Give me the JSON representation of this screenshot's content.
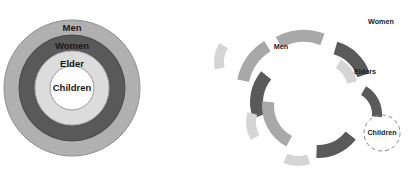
{
  "figure": {
    "title": "",
    "panels": [
      {
        "id": "concentric",
        "name": "concentric-rings-diagram",
        "type": "bullseye",
        "center": {
          "x": 72,
          "y": 88
        },
        "rings": [
          {
            "label": "Men",
            "outer_r": 68,
            "inner_r": 53,
            "color": "#b0b0b0",
            "stroke": "#8f8f8f"
          },
          {
            "label": "Women",
            "outer_r": 53,
            "inner_r": 37,
            "color": "#595959",
            "stroke": "#4a4a4a"
          },
          {
            "label": "Elder",
            "outer_r": 37,
            "inner_r": 22,
            "color": "#dcdcdc",
            "stroke": "#b5b5b5"
          },
          {
            "label": "Children",
            "outer_r": 22,
            "inner_r": 0,
            "color": "#ffffff",
            "stroke": "#9a9a9a"
          }
        ],
        "label_positions": [
          {
            "text": "Men",
            "x": 72,
            "y": 28
          },
          {
            "text": "Women",
            "x": 72,
            "y": 46
          },
          {
            "text": "Elder",
            "x": 72,
            "y": 64
          },
          {
            "text": "Children",
            "x": 72,
            "y": 88
          }
        ]
      },
      {
        "id": "exploded",
        "name": "exploded-arcs-diagram",
        "type": "scattered-arc-fragments",
        "center": {
          "x": 312,
          "y": 96
        },
        "colors": {
          "dark": "#5a5a5a",
          "medium": "#a8a8a8",
          "light": "#d5d5d5",
          "dashed_outline": "#8a8a8a"
        },
        "labels": [
          {
            "text": "Women",
            "x": 381,
            "y": 22
          },
          {
            "text": "Men",
            "x": 281,
            "y": 47
          },
          {
            "text": "Elders",
            "x": 365,
            "y": 72
          },
          {
            "text": "Children",
            "x": 382,
            "y": 133
          }
        ],
        "children_circle": {
          "cx": 382,
          "cy": 133,
          "r": 18,
          "style": "dashed"
        },
        "fragments": [
          {
            "name": "arc-men-upper",
            "cx": 312,
            "cy": 96,
            "r_out": 60,
            "r_in": 48,
            "a0": -118,
            "a1": -70,
            "tone": "medium",
            "dx": -8,
            "dy": -6
          },
          {
            "name": "arc-men-left",
            "cx": 312,
            "cy": 96,
            "r_out": 60,
            "r_in": 48,
            "a0": -168,
            "a1": -122,
            "tone": "medium",
            "dx": -16,
            "dy": -4
          },
          {
            "name": "arc-women-topright",
            "cx": 312,
            "cy": 96,
            "r_out": 48,
            "r_in": 35,
            "a0": -74,
            "a1": -18,
            "tone": "dark",
            "dx": 12,
            "dy": -8
          },
          {
            "name": "arc-women-left",
            "cx": 312,
            "cy": 96,
            "r_out": 48,
            "r_in": 35,
            "a0": 160,
            "a1": 220,
            "tone": "dark",
            "dx": -14,
            "dy": 6
          },
          {
            "name": "arc-women-bottom",
            "cx": 312,
            "cy": 96,
            "r_out": 48,
            "r_in": 35,
            "a0": 38,
            "a1": 92,
            "tone": "dark",
            "dx": 6,
            "dy": 14
          },
          {
            "name": "arc-elders-right",
            "cx": 312,
            "cy": 96,
            "r_out": 36,
            "r_in": 26,
            "a0": -58,
            "a1": -14,
            "tone": "light",
            "dx": 10,
            "dy": -6
          },
          {
            "name": "arc-elders-farleft",
            "cx": 312,
            "cy": 96,
            "r_out": 36,
            "r_in": 26,
            "a0": 168,
            "a1": 212,
            "tone": "light",
            "dx": -62,
            "dy": -34
          },
          {
            "name": "arc-elders-lowleft",
            "cx": 312,
            "cy": 96,
            "r_out": 36,
            "r_in": 26,
            "a0": 150,
            "a1": 196,
            "tone": "light",
            "dx": -30,
            "dy": 26
          },
          {
            "name": "arc-elders-bottom",
            "cx": 312,
            "cy": 96,
            "r_out": 36,
            "r_in": 26,
            "a0": 70,
            "a1": 114,
            "tone": "light",
            "dx": -14,
            "dy": 34
          },
          {
            "name": "arc-inner-right",
            "cx": 312,
            "cy": 96,
            "r_out": 32,
            "r_in": 22,
            "a0": -60,
            "a1": 6,
            "tone": "dark",
            "dx": 38,
            "dy": 18
          },
          {
            "name": "arc-inner-lowleft",
            "cx": 312,
            "cy": 96,
            "r_out": 46,
            "r_in": 34,
            "a0": 118,
            "a1": 186,
            "tone": "medium",
            "dx": -4,
            "dy": 10
          }
        ]
      }
    ]
  }
}
